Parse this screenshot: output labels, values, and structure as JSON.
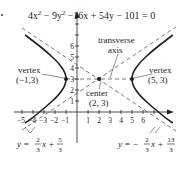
{
  "equation": "4x² − 9y² − 16x + 54y − 101 = 0",
  "equation_parts": {
    "a": "4x",
    "b": " − 9y",
    "c": " −16x + 54y − 101 = 0",
    "sup": "2"
  },
  "labels": {
    "transverse_line1": "transverse",
    "transverse_line2": "axis",
    "vertex_left_title": "vertex",
    "vertex_left_coords": "(−1,3)",
    "vertex_right_title": "vertex",
    "vertex_right_coords": "(5, 3)",
    "center_title": "center",
    "center_coords": "(2, 3)"
  },
  "asymptotes": {
    "left": {
      "prefix": "y = ",
      "num1": "2",
      "den1": "3",
      "mid": "x + ",
      "num2": "5",
      "den2": "3"
    },
    "right": {
      "prefix": "y = − ",
      "num1": "2",
      "den1": "3",
      "mid": "x + ",
      "num2": "13",
      "den2": "3"
    }
  },
  "axes": {
    "x_ticks": [
      "−5",
      "−4",
      "−3",
      "−2",
      "−1",
      "1",
      "2",
      "3",
      "4",
      "5",
      "6"
    ],
    "y_ticks": [
      "1",
      "2",
      "3",
      "4",
      "5",
      "6"
    ]
  },
  "colors": {
    "ink": "#231f20",
    "dash": "#555555"
  }
}
